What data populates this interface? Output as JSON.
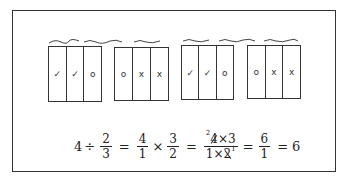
{
  "diagram": {
    "groups": [
      {
        "cells": [
          "✓",
          "✓",
          "o"
        ],
        "brace_spans": [
          "first two sixths",
          "third"
        ]
      },
      {
        "cells": [
          "o",
          "x",
          "x"
        ],
        "brace_spans": [
          "first",
          "last two"
        ]
      },
      {
        "cells": [
          "✓",
          "✓",
          "o"
        ],
        "brace_spans": [
          "first two",
          "third"
        ]
      },
      {
        "cells": [
          "o",
          "x",
          "x"
        ],
        "brace_spans": [
          "first",
          "last two"
        ]
      }
    ],
    "equation": {
      "whole": "4",
      "div_op": "÷",
      "frac1": {
        "num": "2",
        "den": "3"
      },
      "eq1": "=",
      "frac2": {
        "num": "4",
        "den": "1"
      },
      "times1": "×",
      "frac3": {
        "num": "3",
        "den": "2"
      },
      "eq2": "=",
      "frac4": {
        "num_sup": "2",
        "num_a": "4",
        "num_op": "×",
        "num_b": "3",
        "den_a": "1",
        "den_op": "×",
        "den_b": "2",
        "den_sup": "1"
      },
      "eq3": "=",
      "frac5": {
        "num": "6",
        "den": "1"
      },
      "eq4": "=",
      "result": "6"
    }
  }
}
